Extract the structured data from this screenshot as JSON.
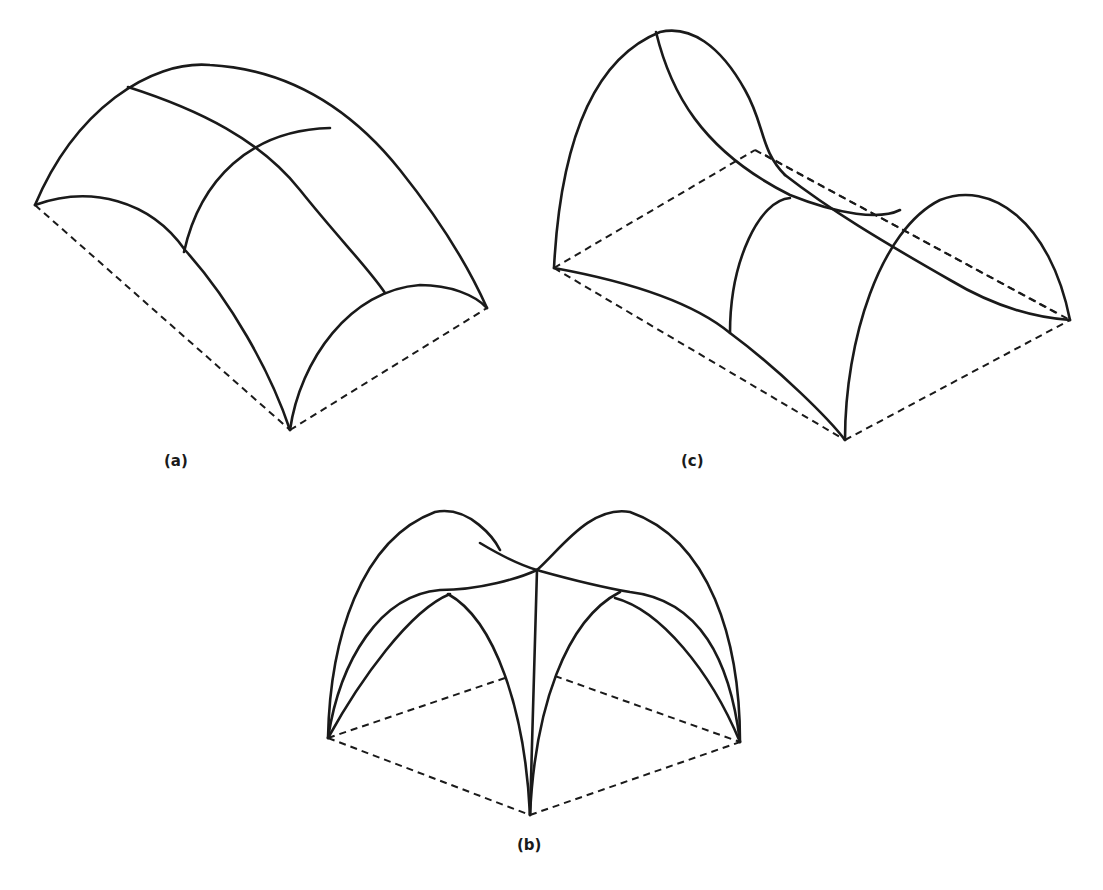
{
  "figures": [
    {
      "id": "a",
      "label": "(a)",
      "description": "Barrel vault over rectangular plan"
    },
    {
      "id": "b",
      "label": "(b)",
      "description": "Cross / groin vault over square plan"
    },
    {
      "id": "c",
      "label": "(c)",
      "description": "Saddle-shaped (hyperbolic) vault over rectangular plan"
    }
  ],
  "colors": {
    "line": "#1a1a1a",
    "background": "#ffffff"
  }
}
